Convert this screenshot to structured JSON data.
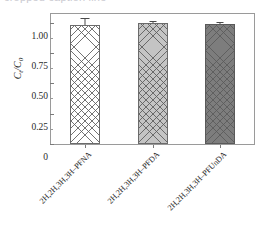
{
  "top_sliver": {
    "text": "cropped caption line"
  },
  "chart_data": {
    "type": "bar",
    "title": "",
    "subtitle": "",
    "xlabel": "",
    "ylabel": "C_t/C_0",
    "ylabel_main": "C",
    "ylabel_sub1": "t",
    "ylabel_sep": "/C",
    "ylabel_sub2": "0",
    "categories": [
      "2H,2H,3H,3H–PFNA",
      "2H,2H,3H,3H–PFDA",
      "2H,2H,3H,3H–PFUnDA"
    ],
    "values": [
      0.98,
      1.0,
      0.99
    ],
    "errors": [
      0.05,
      0.008,
      0.008
    ],
    "ylim": [
      0,
      1.07
    ],
    "ytick_values": [
      0,
      0.25,
      0.5,
      0.75,
      1.0
    ],
    "ytick_labels": [
      "0",
      "0.25",
      "0.50",
      "0.75",
      "1.00"
    ],
    "yminor_values": [
      0.125,
      0.375,
      0.625,
      0.875
    ],
    "grid": false,
    "legend": "none",
    "bar_styles": [
      {
        "name": "white-crosshatch",
        "fill": "#ffffff",
        "edge": "#6b6b6b",
        "pattern": "crosshatch"
      },
      {
        "name": "lightgray-crosshatch",
        "fill": "#c4c4c4",
        "edge": "#6b6b6b",
        "pattern": "crosshatch"
      },
      {
        "name": "darkgray-crosshatch",
        "fill": "#7d7d7d",
        "edge": "#5a5a5a",
        "pattern": "crosshatch"
      }
    ],
    "axis_color": "#9a9a9a",
    "text_color": "#2a2a2a"
  }
}
